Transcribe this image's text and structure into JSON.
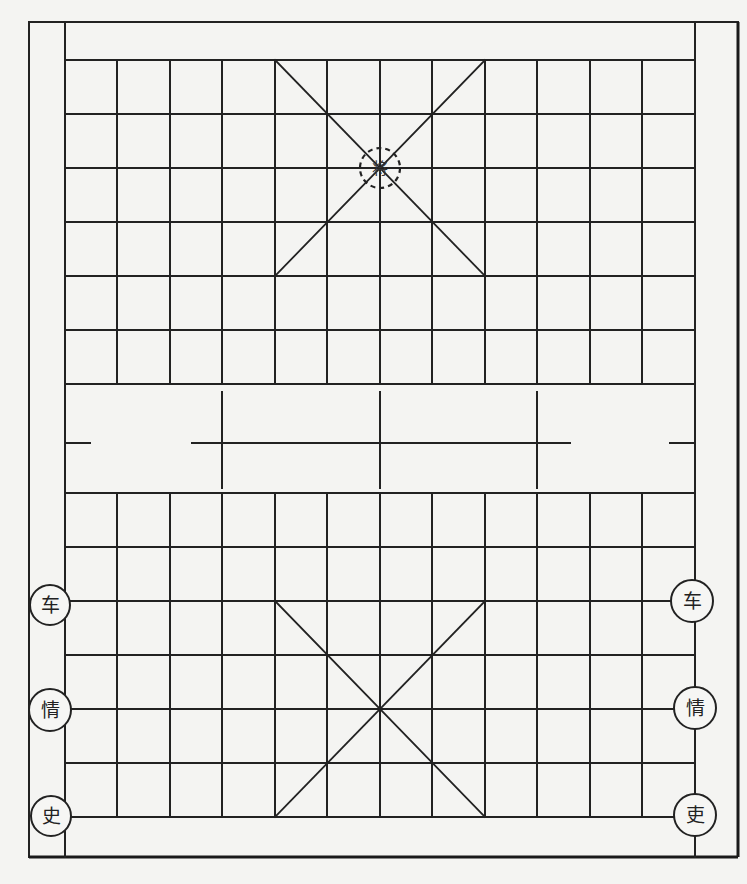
{
  "diagram": {
    "type": "xiangqi-board",
    "colors": {
      "line": "#222222",
      "background": "#f4f4f2",
      "piece_fill": "#f6f6f4"
    },
    "grid": {
      "columns_x": [
        65,
        117,
        170,
        222,
        275,
        327,
        380,
        432,
        485,
        537,
        590,
        642,
        695
      ],
      "top_rows_y": [
        60,
        114,
        168,
        222,
        276,
        330,
        384
      ],
      "bottom_rows_y": [
        493,
        547,
        601,
        655,
        709,
        763,
        817
      ],
      "outer_frame": {
        "x1": 29,
        "y1": 22,
        "x2": 738,
        "y2": 857
      },
      "river": {
        "y_top": 384,
        "y_bottom": 493,
        "center_line_y": 443
      }
    },
    "top_palace": {
      "x1": 275,
      "y1": 60,
      "x2": 485,
      "y2": 276,
      "center": [
        380,
        168
      ]
    },
    "bottom_palace": {
      "x1": 275,
      "y1": 601,
      "x2": 485,
      "y2": 817,
      "center": [
        380,
        709
      ]
    },
    "marker": {
      "label": "将",
      "x": 380,
      "y": 168,
      "style": "dashed-circle"
    },
    "pieces": [
      {
        "label": "车",
        "x": 50,
        "y": 605,
        "side": "left"
      },
      {
        "label": "情",
        "x": 50,
        "y": 710,
        "side": "left"
      },
      {
        "label": "史",
        "x": 50,
        "y": 816,
        "side": "left"
      },
      {
        "label": "车",
        "x": 692,
        "y": 601,
        "side": "right"
      },
      {
        "label": "情",
        "x": 695,
        "y": 708,
        "side": "right"
      },
      {
        "label": "吏",
        "x": 695,
        "y": 815,
        "side": "right"
      }
    ]
  }
}
